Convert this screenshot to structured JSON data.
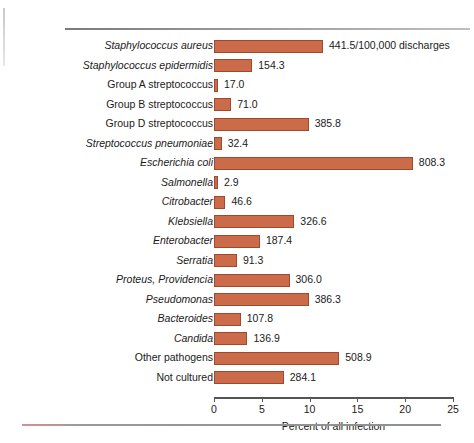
{
  "chart_data": {
    "type": "bar",
    "orientation": "horizontal",
    "title": "",
    "xlabel": "Percent of all infection",
    "ylabel": "",
    "xlim": [
      0,
      25
    ],
    "xticks": [
      0,
      5,
      10,
      15,
      20,
      25
    ],
    "grid": false,
    "legend": null,
    "bar_color": "#cc6b4a",
    "bar_border_color": "#9e4a2c",
    "categories": [
      "Staphylococcus aureus",
      "Staphylococcus epidermidis",
      "Group A streptococcus",
      "Group B streptococcus",
      "Group D streptococcus",
      "Streptococcus pneumoniae",
      "Escherichia coli",
      "Salmonella",
      "Citrobacter",
      "Klebsiella",
      "Enterobacter",
      "Serratia",
      "Proteus, Providencia",
      "Pseudomonas",
      "Bacteroides",
      "Candida",
      "Other pathogens",
      "Not cultured"
    ],
    "data_labels": [
      "441.5/100,000 discharges",
      "154.3",
      "17.0",
      "71.0",
      "385.8",
      "32.4",
      "808.3",
      "2.9",
      "46.6",
      "326.6",
      "187.4",
      "91.3",
      "306.0",
      "386.3",
      "107.8",
      "136.9",
      "508.9",
      "284.1"
    ],
    "rates_per_100000_discharges": [
      441.5,
      154.3,
      17.0,
      71.0,
      385.8,
      32.4,
      808.3,
      2.9,
      46.6,
      326.6,
      187.4,
      91.3,
      306.0,
      386.3,
      107.8,
      136.9,
      508.9,
      284.1
    ],
    "values": [
      11.4,
      4.0,
      0.4,
      1.8,
      9.9,
      0.8,
      20.8,
      0.1,
      1.2,
      8.4,
      4.8,
      2.4,
      7.9,
      9.9,
      2.8,
      3.5,
      13.1,
      7.3
    ],
    "label_styles": [
      "italic",
      "italic",
      "roman",
      "roman",
      "roman",
      "italic",
      "italic",
      "italic",
      "italic",
      "italic",
      "italic",
      "italic",
      "italic",
      "italic",
      "italic",
      "italic",
      "roman",
      "roman"
    ]
  }
}
